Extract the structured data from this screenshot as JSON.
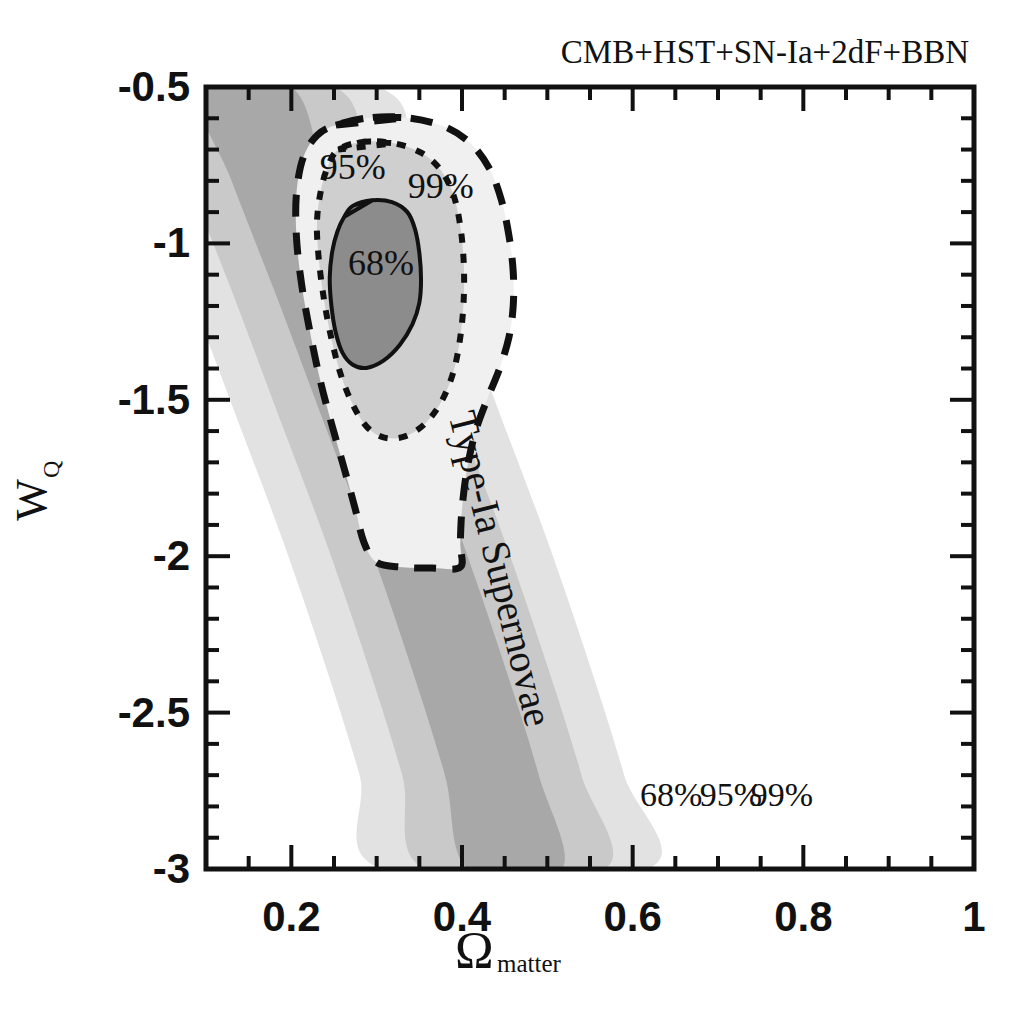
{
  "figure": {
    "title": "CMB+HST+SN-Ia+2dF+BBN",
    "background_color": "#ffffff",
    "frame_color": "#111111"
  },
  "chart_data": {
    "type": "contour",
    "title": "CMB+HST+SN-Ia+2dF+BBN",
    "xlabel_symbol": "Ω",
    "xlabel_sub": "matter",
    "ylabel_symbol": "W",
    "ylabel_sub": "Q",
    "xlim": [
      0.1,
      1.0
    ],
    "ylim": [
      -3.0,
      -0.5
    ],
    "grid": false,
    "legend": "inline-labels",
    "x_ticks_major": [
      "0.2",
      "0.4",
      "0.6",
      "0.8",
      "1"
    ],
    "x_ticks_major_values": [
      0.2,
      0.4,
      0.6,
      0.8,
      1.0
    ],
    "x_tick_minor_step": 0.05,
    "y_ticks_major": [
      "-0.5",
      "-1",
      "-1.5",
      "-2",
      "-2.5",
      "-3"
    ],
    "y_ticks_major_values": [
      -0.5,
      -1.0,
      -1.5,
      -2.0,
      -2.5,
      -3.0
    ],
    "y_tick_minor_step": 0.1,
    "datasets": [
      {
        "name": "Type-Ia Supernovae",
        "render": "filled-bands",
        "annotation": "Type-Ia Supernovae",
        "annotation_xy": [
          0.43,
          -2.05
        ],
        "annotation_rotation_deg": -76,
        "levels": [
          {
            "label": "68%",
            "fill": "#a8a8a8",
            "label_xy": [
              0.645,
              -2.8
            ]
          },
          {
            "label": "95%",
            "fill": "#c9c9c9",
            "label_xy": [
              0.715,
              -2.8
            ]
          },
          {
            "label": "99%",
            "fill": "#e2e2e2",
            "label_xy": [
              0.775,
              -2.8
            ]
          }
        ],
        "band_centerline": [
          [
            0.145,
            -0.5
          ],
          [
            0.185,
            -0.8
          ],
          [
            0.235,
            -1.15
          ],
          [
            0.29,
            -1.55
          ],
          [
            0.345,
            -1.95
          ],
          [
            0.395,
            -2.35
          ],
          [
            0.435,
            -2.7
          ],
          [
            0.462,
            -3.0
          ]
        ],
        "band_halfwidths": {
          "68": 0.055,
          "95": 0.105,
          "99": 0.155
        }
      },
      {
        "name": "CMB+HST+SN-Ia+2dF+BBN joint",
        "render": "contour-lines",
        "levels": [
          {
            "label": "68%",
            "style": "solid",
            "fill": "#8c8c8c",
            "label_xy": [
              0.305,
              -1.1
            ],
            "path": [
              [
                0.262,
                -0.915
              ],
              [
                0.272,
                -0.88
              ],
              [
                0.295,
                -0.862
              ],
              [
                0.318,
                -0.868
              ],
              [
                0.336,
                -0.9
              ],
              [
                0.345,
                -0.955
              ],
              [
                0.35,
                -1.03
              ],
              [
                0.352,
                -1.115
              ],
              [
                0.35,
                -1.19
              ],
              [
                0.342,
                -1.258
              ],
              [
                0.327,
                -1.325
              ],
              [
                0.308,
                -1.375
              ],
              [
                0.288,
                -1.398
              ],
              [
                0.272,
                -1.388
              ],
              [
                0.26,
                -1.35
              ],
              [
                0.252,
                -1.285
              ],
              [
                0.247,
                -1.2
              ],
              [
                0.245,
                -1.11
              ],
              [
                0.248,
                -1.025
              ],
              [
                0.254,
                -0.962
              ]
            ]
          },
          {
            "label": "95%",
            "style": "dotted",
            "fill": "#cfcfcf",
            "label_xy": [
              0.272,
              -0.795
            ],
            "path": [
              [
                0.255,
                -0.7
              ],
              [
                0.285,
                -0.675
              ],
              [
                0.32,
                -0.68
              ],
              [
                0.352,
                -0.71
              ],
              [
                0.375,
                -0.765
              ],
              [
                0.39,
                -0.845
              ],
              [
                0.398,
                -0.945
              ],
              [
                0.402,
                -1.06
              ],
              [
                0.402,
                -1.18
              ],
              [
                0.398,
                -1.3
              ],
              [
                0.39,
                -1.41
              ],
              [
                0.376,
                -1.505
              ],
              [
                0.356,
                -1.578
              ],
              [
                0.332,
                -1.618
              ],
              [
                0.308,
                -1.62
              ],
              [
                0.288,
                -1.585
              ],
              [
                0.272,
                -1.515
              ],
              [
                0.258,
                -1.42
              ],
              [
                0.247,
                -1.305
              ],
              [
                0.238,
                -1.175
              ],
              [
                0.232,
                -1.045
              ],
              [
                0.23,
                -0.935
              ],
              [
                0.234,
                -0.84
              ],
              [
                0.242,
                -0.76
              ]
            ]
          },
          {
            "label": "99%",
            "style": "dashed",
            "fill": "#f0f0f0",
            "label_xy": [
              0.375,
              -0.855
            ],
            "path": [
              [
                0.252,
                -0.622
              ],
              [
                0.292,
                -0.598
              ],
              [
                0.335,
                -0.598
              ],
              [
                0.378,
                -0.625
              ],
              [
                0.41,
                -0.68
              ],
              [
                0.432,
                -0.76
              ],
              [
                0.446,
                -0.86
              ],
              [
                0.455,
                -0.975
              ],
              [
                0.46,
                -1.09
              ],
              [
                0.46,
                -1.2
              ],
              [
                0.455,
                -1.3
              ],
              [
                0.444,
                -1.4
              ],
              [
                0.43,
                -1.495
              ],
              [
                0.416,
                -1.6
              ],
              [
                0.406,
                -1.72
              ],
              [
                0.4,
                -1.85
              ],
              [
                0.398,
                -1.96
              ],
              [
                0.398,
                -2.035
              ],
              [
                0.365,
                -2.038
              ],
              [
                0.33,
                -2.035
              ],
              [
                0.3,
                -2.02
              ],
              [
                0.285,
                -1.955
              ],
              [
                0.275,
                -1.85
              ],
              [
                0.262,
                -1.72
              ],
              [
                0.248,
                -1.585
              ],
              [
                0.234,
                -1.44
              ],
              [
                0.222,
                -1.285
              ],
              [
                0.212,
                -1.13
              ],
              [
                0.206,
                -0.98
              ],
              [
                0.206,
                -0.84
              ],
              [
                0.214,
                -0.725
              ],
              [
                0.23,
                -0.655
              ]
            ]
          }
        ]
      }
    ]
  }
}
